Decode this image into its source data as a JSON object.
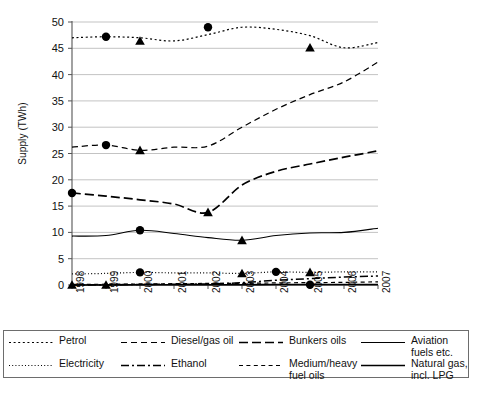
{
  "chart_data": {
    "type": "line",
    "title": "",
    "xlabel": "",
    "ylabel": "Supply (TWh)",
    "x": [
      1998,
      1999,
      2000,
      2001,
      2002,
      2003,
      2004,
      2005,
      2006,
      2007
    ],
    "xticklabels": [
      "1998",
      "1999",
      "2000",
      "2001",
      "2002",
      "2003",
      "2004",
      "2005",
      "2006",
      "2007"
    ],
    "yticks": [
      0,
      5,
      10,
      15,
      20,
      25,
      30,
      35,
      40,
      45,
      50
    ],
    "yticklabels": [
      "0",
      "5",
      "10",
      "15",
      "20",
      "25",
      "30",
      "35",
      "40",
      "45",
      "50"
    ],
    "ylim": [
      0,
      50
    ],
    "grid": "horizontal",
    "legend_position": "below-plot",
    "series": [
      {
        "name": "Petrol",
        "dash": "dotted-fine",
        "values": [
          47.0,
          47.2,
          47.0,
          46.4,
          47.6,
          49.0,
          48.6,
          47.4,
          45.1,
          46.1
        ],
        "markers": [
          {
            "x": 1999,
            "y": 47.2,
            "shape": "circle"
          },
          {
            "x": 2000,
            "y": 46.4,
            "shape": "triangle"
          },
          {
            "x": 2002,
            "y": 49.0,
            "shape": "circle"
          },
          {
            "x": 2005,
            "y": 45.1,
            "shape": "triangle"
          }
        ]
      },
      {
        "name": "Diesel/gas oil",
        "dash": "dashed",
        "values": [
          26.2,
          26.6,
          25.6,
          26.2,
          26.4,
          30.0,
          33.4,
          36.2,
          38.6,
          42.4
        ],
        "markers": [
          {
            "x": 1999,
            "y": 26.6,
            "shape": "circle"
          },
          {
            "x": 2000,
            "y": 25.6,
            "shape": "triangle"
          }
        ]
      },
      {
        "name": "Bunkers oils",
        "dash": "long-dash-dot",
        "values": [
          17.5,
          16.9,
          16.2,
          15.4,
          13.8,
          19.0,
          21.6,
          23.0,
          24.3,
          25.5
        ],
        "markers": [
          {
            "x": 1998,
            "y": 17.5,
            "shape": "circle"
          },
          {
            "x": 2002,
            "y": 13.8,
            "shape": "triangle"
          }
        ]
      },
      {
        "name": "Aviation fuels etc.",
        "dash": "solid-thin",
        "values": [
          9.3,
          9.4,
          10.4,
          9.8,
          9.0,
          8.5,
          9.4,
          9.9,
          10.0,
          10.8
        ],
        "markers": [
          {
            "x": 2000,
            "y": 10.4,
            "shape": "circle"
          },
          {
            "x": 2003,
            "y": 8.5,
            "shape": "triangle"
          }
        ]
      },
      {
        "name": "Electricity",
        "dash": "dotted",
        "values": [
          2.1,
          2.2,
          2.4,
          2.3,
          2.3,
          2.2,
          2.5,
          2.4,
          2.5,
          2.5
        ],
        "markers": [
          {
            "x": 2000,
            "y": 2.4,
            "shape": "circle"
          },
          {
            "x": 2003,
            "y": 2.2,
            "shape": "triangle"
          },
          {
            "x": 2004,
            "y": 2.5,
            "shape": "circle"
          },
          {
            "x": 2005,
            "y": 2.4,
            "shape": "triangle"
          }
        ]
      },
      {
        "name": "Ethanol",
        "dash": "dash-dot",
        "values": [
          0.0,
          0.05,
          0.1,
          0.15,
          0.2,
          0.45,
          0.9,
          1.2,
          1.5,
          1.7
        ],
        "markers": []
      },
      {
        "name": "Medium/heavy fuel oils",
        "dash": "short-dash",
        "values": [
          0.1,
          0.15,
          0.2,
          0.25,
          0.3,
          0.3,
          0.4,
          0.45,
          0.5,
          0.6
        ],
        "markers": []
      },
      {
        "name": "Natural gas, incl. LPG",
        "dash": "solid",
        "values": [
          0.0,
          0.0,
          0.05,
          0.05,
          0.05,
          0.05,
          0.1,
          0.1,
          0.1,
          0.1
        ],
        "markers": [
          {
            "x": 1998,
            "y": 0.0,
            "shape": "triangle"
          },
          {
            "x": 1999,
            "y": 0.0,
            "shape": "triangle"
          },
          {
            "x": 2005,
            "y": 0.05,
            "shape": "circle"
          }
        ]
      }
    ]
  },
  "legend": {
    "items": [
      {
        "label": "Petrol",
        "key": "dotted-fine"
      },
      {
        "label": "Diesel/gas oil",
        "key": "dashed"
      },
      {
        "label": "Bunkers oils",
        "key": "long-dash-dot"
      },
      {
        "label": "Aviation fuels etc.",
        "key": "solid-thin"
      },
      {
        "label": "Electricity",
        "key": "dotted"
      },
      {
        "label": "Ethanol",
        "key": "dash-dot"
      },
      {
        "label": "Medium/heavy fuel oils",
        "key": "short-dash"
      },
      {
        "label": "Natural gas, incl. LPG",
        "key": "solid"
      }
    ]
  },
  "footer": {
    "page_number": ""
  },
  "colors": {
    "ink": "#000000",
    "grid": "#b4b4b4",
    "axis": "#555555",
    "legend_border": "#6d6d6d"
  }
}
